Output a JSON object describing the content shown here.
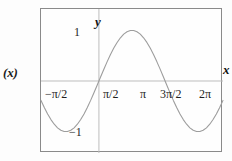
{
  "figure": {
    "outer_label": "(x)",
    "width": 232,
    "height": 161,
    "background_color": "#fdfdfd",
    "frame_color": "#8a8a8a",
    "axis_color": "#b9b9b9",
    "curve_color": "#9a9a9a"
  },
  "axes": {
    "y_axis_name": "y",
    "x_axis_name": "x"
  },
  "chart_data": {
    "type": "line",
    "title": "",
    "xlabel": "x",
    "ylabel": "y",
    "function": "y = sin(x)",
    "grid": false,
    "legend": "none",
    "xlim": [
      -2.748893571891069,
      5.890486225480862
    ],
    "ylim": [
      -1.42,
      1.42
    ],
    "x_tick_labels": [
      "−π/2",
      "π/2",
      "π",
      "3π/2",
      "2π"
    ],
    "x_tick_values": [
      -1.5707963,
      1.5707963,
      3.1415927,
      4.712389,
      6.2831853
    ],
    "y_tick_labels": [
      "1",
      "−1"
    ],
    "y_tick_values": [
      1,
      -1
    ],
    "x": [
      -2.7489,
      -2.5918,
      -2.4347,
      -2.2777,
      -2.1206,
      -1.9635,
      -1.8064,
      -1.6493,
      -1.4923,
      -1.3352,
      -1.1781,
      -1.021,
      -0.8639,
      -0.7069,
      -0.5498,
      -0.3927,
      -0.2356,
      -0.0785,
      0.0785,
      0.2356,
      0.3927,
      0.5498,
      0.7069,
      0.8639,
      1.021,
      1.1781,
      1.3352,
      1.4923,
      1.6493,
      1.8064,
      1.9635,
      2.1206,
      2.2777,
      2.4347,
      2.5918,
      2.7489,
      2.906,
      3.0631,
      3.2201,
      3.3772,
      3.5343,
      3.6914,
      3.8485,
      4.0055,
      4.1626,
      4.3197,
      4.4768,
      4.6338,
      4.7909,
      4.948,
      5.1051,
      5.2622,
      5.4192,
      5.5763,
      5.7334,
      5.8905
    ],
    "y": [
      -0.3827,
      -0.5225,
      -0.6494,
      -0.7604,
      -0.8526,
      -0.9239,
      -0.9724,
      -0.997,
      -0.9969,
      -0.9722,
      -0.9237,
      -0.8523,
      -0.76,
      -0.649,
      -0.5222,
      -0.3824,
      -0.2334,
      -0.0784,
      0.0784,
      0.2334,
      0.3824,
      0.5222,
      0.649,
      0.76,
      0.8523,
      0.9237,
      0.9722,
      0.9969,
      0.997,
      0.9724,
      0.9239,
      0.8526,
      0.7604,
      0.6494,
      0.5225,
      0.3827,
      0.2338,
      0.0785,
      -0.0785,
      -0.2338,
      -0.3827,
      -0.5225,
      -0.6494,
      -0.7604,
      -0.8526,
      -0.9239,
      -0.9724,
      -0.997,
      -0.9969,
      -0.9722,
      -0.9237,
      -0.8523,
      -0.76,
      -0.649,
      -0.5222,
      -0.3824
    ]
  }
}
